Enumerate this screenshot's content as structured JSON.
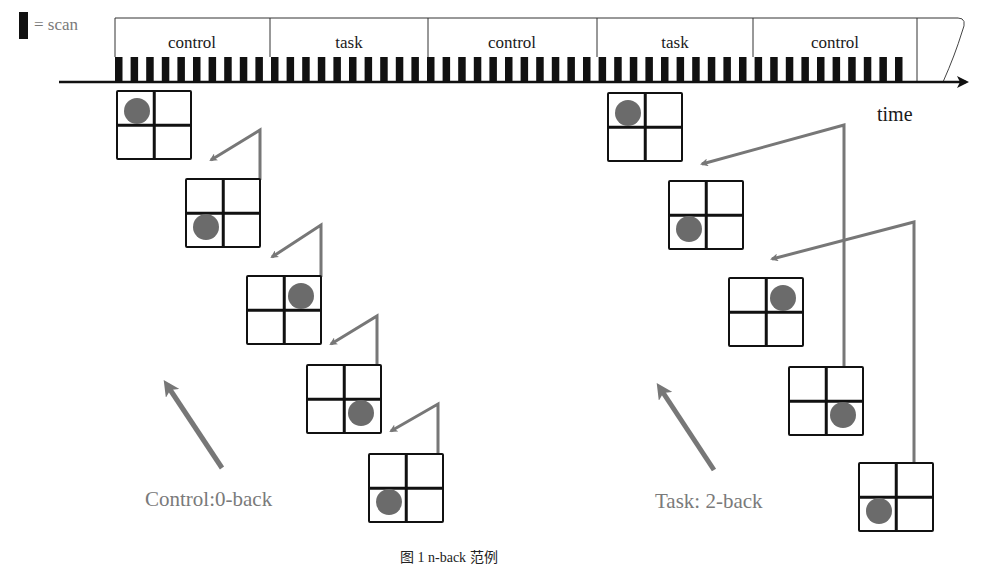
{
  "legend": {
    "symbol": "scan-bar",
    "label": "= scan"
  },
  "timeline": {
    "segments": [
      {
        "label": "control",
        "x0": 115,
        "x1": 270
      },
      {
        "label": "task",
        "x0": 270,
        "x1": 428
      },
      {
        "label": "control",
        "x0": 428,
        "x1": 597
      },
      {
        "label": "task",
        "x0": 597,
        "x1": 753
      },
      {
        "label": "control",
        "x0": 753,
        "x1": 917
      }
    ],
    "axis_label": "time"
  },
  "control_panel": {
    "label": "Control:0-back",
    "grids": [
      {
        "dot": "tl"
      },
      {
        "dot": "bl"
      },
      {
        "dot": "tr"
      },
      {
        "dot": "br"
      },
      {
        "dot": "bl"
      }
    ]
  },
  "task_panel": {
    "label": "Task: 2-back",
    "grids": [
      {
        "dot": "tl"
      },
      {
        "dot": "bl"
      },
      {
        "dot": "tr"
      },
      {
        "dot": "br"
      },
      {
        "dot": "bl"
      }
    ]
  },
  "colors": {
    "line": "#111111",
    "arrow": "#777777",
    "dot": "#6b6b6b",
    "label_grey": "#7a7a7a"
  },
  "caption": "图 1   n-back 范例"
}
